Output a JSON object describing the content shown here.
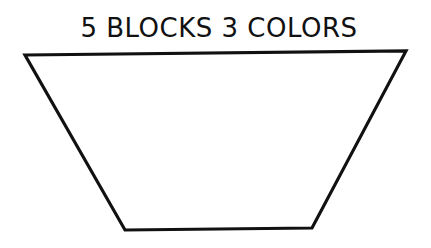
{
  "title": "5 BLOCKS 3 COLORS",
  "shape": {
    "type": "trapezoid",
    "stroke_color": "#111111",
    "fill_color": "#ffffff"
  }
}
